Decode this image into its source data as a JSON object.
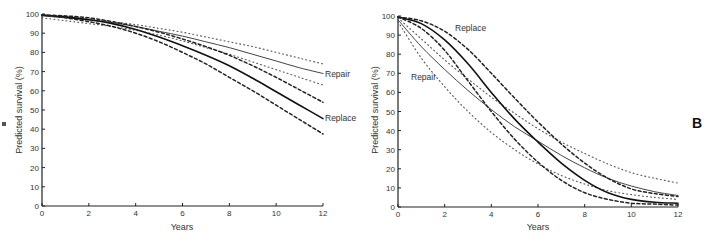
{
  "chart_data": [
    {
      "type": "line",
      "panel": "A",
      "title": "",
      "xlabel": "Years",
      "ylabel": "Predicted survival (%)",
      "xlim": [
        0,
        12
      ],
      "ylim": [
        0,
        100
      ],
      "xticks": [
        0,
        2,
        4,
        6,
        8,
        10,
        12
      ],
      "yticks": [
        0,
        10,
        20,
        30,
        40,
        50,
        60,
        70,
        80,
        90,
        100
      ],
      "grid": false,
      "legend": "inline labels at line ends",
      "x": [
        0,
        1,
        2,
        3,
        4,
        5,
        6,
        7,
        8,
        9,
        10,
        11,
        12
      ],
      "series": [
        {
          "name": "Repair",
          "style": "solid-thin",
          "values": [
            99,
            98,
            97,
            95.5,
            93.5,
            91,
            88.5,
            85.5,
            82.5,
            79,
            75.5,
            72,
            69
          ]
        },
        {
          "name": "Repair upper CI",
          "style": "dotted",
          "values": [
            99,
            98.5,
            97.5,
            96,
            94.5,
            92.5,
            90.5,
            88,
            85.5,
            83,
            80,
            77,
            74
          ]
        },
        {
          "name": "Repair lower CI",
          "style": "dotted",
          "values": [
            98,
            96.5,
            95,
            93.5,
            91.5,
            89,
            86,
            82.5,
            79,
            75,
            71,
            67,
            63
          ]
        },
        {
          "name": "Replace",
          "style": "solid-thick",
          "values": [
            99.5,
            98.5,
            97,
            95,
            92,
            88,
            83.5,
            78.5,
            73,
            66.5,
            59.5,
            52.5,
            45.5
          ]
        },
        {
          "name": "Replace upper CI",
          "style": "dashed",
          "values": [
            99.5,
            99,
            98,
            96,
            93.5,
            90.5,
            87,
            83,
            78.5,
            73,
            67,
            60.5,
            54
          ]
        },
        {
          "name": "Replace lower CI",
          "style": "dashed",
          "values": [
            99.5,
            98,
            96,
            93.5,
            90,
            85.5,
            80,
            74,
            67,
            60,
            52.5,
            45,
            37.5
          ]
        }
      ],
      "annotations": [
        {
          "text": "Repair",
          "x": 12,
          "y": 69
        },
        {
          "text": "Replace",
          "x": 12,
          "y": 45.5
        }
      ]
    },
    {
      "type": "line",
      "panel": "B",
      "title": "",
      "xlabel": "Years",
      "ylabel": "Predicted survival (%)",
      "xlim": [
        0,
        12
      ],
      "ylim": [
        0,
        100
      ],
      "xticks": [
        0,
        2,
        4,
        6,
        8,
        10,
        12
      ],
      "yticks": [
        0,
        10,
        20,
        30,
        40,
        50,
        60,
        70,
        80,
        90,
        100
      ],
      "grid": false,
      "legend": "inline labels",
      "x": [
        0,
        1,
        2,
        3,
        4,
        5,
        6,
        7,
        8,
        9,
        10,
        11,
        12
      ],
      "series": [
        {
          "name": "Repair",
          "style": "solid-thin",
          "values": [
            98,
            84,
            72,
            61,
            51,
            42,
            34.5,
            27,
            20.5,
            15,
            11,
            8,
            6
          ]
        },
        {
          "name": "Repair upper CI",
          "style": "dotted",
          "values": [
            99,
            88,
            77,
            67,
            57.5,
            49,
            41,
            34,
            28,
            22.5,
            18,
            15,
            12.5
          ]
        },
        {
          "name": "Repair lower CI",
          "style": "dotted",
          "values": [
            97,
            78,
            63,
            50,
            39,
            30,
            22.5,
            16.5,
            12,
            8.5,
            6.5,
            5,
            4
          ]
        },
        {
          "name": "Replace",
          "style": "solid-thick",
          "values": [
            99.5,
            96,
            87.5,
            75,
            60,
            46,
            34,
            23,
            14,
            7.5,
            4,
            2.5,
            2
          ]
        },
        {
          "name": "Replace upper CI",
          "style": "dashed",
          "values": [
            99.5,
            97.5,
            92,
            82.5,
            70,
            57,
            44.5,
            33,
            23,
            15,
            9.5,
            7,
            5.5
          ]
        },
        {
          "name": "Replace lower CI",
          "style": "dashed",
          "values": [
            99.5,
            93.5,
            82,
            66,
            50,
            35.5,
            23.5,
            14,
            7.5,
            4,
            2,
            1.5,
            1
          ]
        }
      ],
      "annotations": [
        {
          "text": "Replace",
          "x": 3.5,
          "y": 90
        },
        {
          "text": "Repair",
          "x": 1,
          "y": 69
        }
      ]
    }
  ],
  "panels": {
    "a": {
      "ylabel": "Predicted survival (%)",
      "xlabel": "Years",
      "label_repair": "Repair",
      "label_replace": "Replace"
    },
    "b": {
      "ylabel": "Predicted survival (%)",
      "xlabel": "Years",
      "label_repair": "Repair",
      "label_replace": "Replace",
      "panel_letter": "B"
    }
  }
}
